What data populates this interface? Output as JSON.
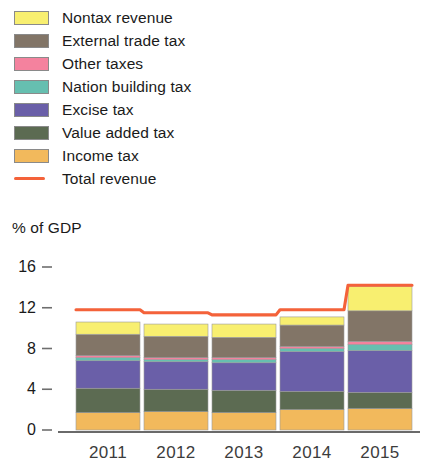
{
  "axis_title": "% of GDP",
  "legend": {
    "items": [
      {
        "label": "Nontax revenue",
        "color": "#f8ef70",
        "type": "swatch",
        "icon": "color-swatch-icon"
      },
      {
        "label": "External trade tax",
        "color": "#827567",
        "type": "swatch",
        "icon": "color-swatch-icon"
      },
      {
        "label": "Other taxes",
        "color": "#f4829e",
        "type": "swatch",
        "icon": "color-swatch-icon"
      },
      {
        "label": "Nation building tax",
        "color": "#66bfb0",
        "type": "swatch",
        "icon": "color-swatch-icon"
      },
      {
        "label": "Excise tax",
        "color": "#6a5fa8",
        "type": "swatch",
        "icon": "color-swatch-icon"
      },
      {
        "label": "Value added tax",
        "color": "#5c6b52",
        "type": "swatch",
        "icon": "color-swatch-icon"
      },
      {
        "label": "Income tax",
        "color": "#f2b95c",
        "type": "swatch",
        "icon": "color-swatch-icon"
      },
      {
        "label": "Total revenue",
        "color": "#f4623a",
        "type": "line",
        "icon": "line-sample-icon"
      }
    ]
  },
  "chart_data": {
    "type": "bar",
    "stacked": true,
    "title": "",
    "subtitle": "",
    "xlabel": "",
    "ylabel": "% of GDP",
    "categories": [
      "2011",
      "2012",
      "2013",
      "2014",
      "2015"
    ],
    "ylim": [
      0,
      16
    ],
    "yticks": [
      0,
      4,
      8,
      12,
      16
    ],
    "ytick_labels": [
      "0",
      "4",
      "8",
      "12",
      "16"
    ],
    "grid": false,
    "legend_position": "top-left",
    "series": [
      {
        "name": "Income tax",
        "color": "#f2b95c",
        "values": [
          1.7,
          1.8,
          1.7,
          2.0,
          2.1
        ]
      },
      {
        "name": "Value added tax",
        "color": "#5c6b52",
        "values": [
          2.4,
          2.2,
          2.2,
          1.8,
          1.6
        ]
      },
      {
        "name": "Excise tax",
        "color": "#6a5fa8",
        "values": [
          2.7,
          2.7,
          2.7,
          3.9,
          4.1
        ]
      },
      {
        "name": "Nation building tax",
        "color": "#66bfb0",
        "values": [
          0.3,
          0.2,
          0.3,
          0.3,
          0.6
        ]
      },
      {
        "name": "Other taxes",
        "color": "#f4829e",
        "values": [
          0.2,
          0.2,
          0.2,
          0.2,
          0.3
        ]
      },
      {
        "name": "External trade tax",
        "color": "#827567",
        "values": [
          2.1,
          2.1,
          2.0,
          2.1,
          3.0
        ]
      },
      {
        "name": "Nontax revenue",
        "color": "#f8ef70",
        "values": [
          1.2,
          1.2,
          1.3,
          0.8,
          2.4
        ]
      }
    ],
    "totals": [
      10.6,
      10.4,
      10.4,
      11.1,
      14.1
    ],
    "overlay_line": {
      "name": "Total revenue",
      "color": "#f4623a",
      "x": [
        "2011",
        "2012",
        "2013",
        "2014",
        "2015"
      ],
      "values": [
        11.8,
        11.5,
        11.3,
        11.8,
        14.2
      ]
    }
  }
}
